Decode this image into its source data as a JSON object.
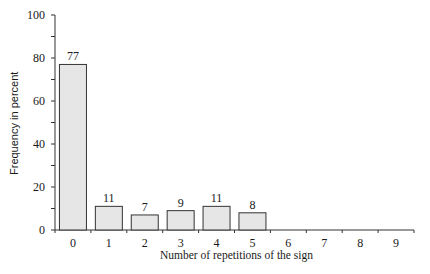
{
  "chart_data": {
    "type": "bar",
    "title": "",
    "xlabel": "Number of repetitions of the sign",
    "ylabel": "Frequency in percent",
    "categories": [
      "0",
      "1",
      "2",
      "3",
      "4",
      "5",
      "6",
      "7",
      "8",
      "9"
    ],
    "values": [
      77,
      11,
      7,
      9,
      11,
      8,
      0,
      0,
      0,
      0
    ],
    "data_labels": [
      "77",
      "11",
      "7",
      "9",
      "11",
      "8",
      "",
      "",
      "",
      ""
    ],
    "ylim": [
      0,
      100
    ],
    "yticks": [
      0,
      20,
      40,
      60,
      80,
      100
    ],
    "grid": false,
    "legend": null,
    "bar_fill": "#e6e6e6",
    "bar_stroke": "#333333"
  }
}
